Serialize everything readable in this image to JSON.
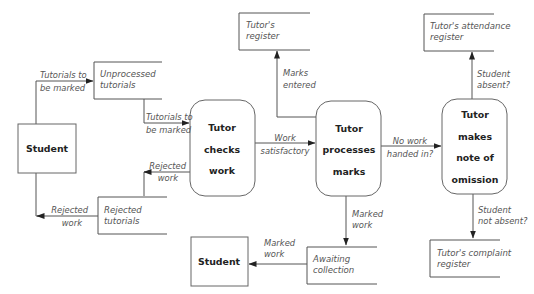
{
  "diagram": {
    "type": "data-flow-diagram",
    "external_entities": [
      {
        "id": "student_left",
        "label": "Student"
      },
      {
        "id": "student_bottom",
        "label": "Student"
      }
    ],
    "processes": [
      {
        "id": "checks",
        "lines": [
          "Tutor",
          "checks",
          "work"
        ]
      },
      {
        "id": "processes",
        "lines": [
          "Tutor",
          "processes",
          "marks"
        ]
      },
      {
        "id": "omission",
        "lines": [
          "Tutor",
          "makes",
          "note of",
          "omission"
        ]
      }
    ],
    "data_stores": [
      {
        "id": "unprocessed",
        "lines": [
          "Unprocessed",
          "tutorials"
        ]
      },
      {
        "id": "rejected",
        "lines": [
          "Rejected",
          "tutorials"
        ]
      },
      {
        "id": "tutors_register",
        "lines": [
          "Tutor's",
          "register"
        ]
      },
      {
        "id": "awaiting",
        "lines": [
          "Awaiting",
          "collection"
        ]
      },
      {
        "id": "attendance",
        "lines": [
          "Tutor's attendance",
          "register"
        ]
      },
      {
        "id": "complaint",
        "lines": [
          "Tutor's complaint",
          "register"
        ]
      }
    ],
    "flows": [
      {
        "id": "f1",
        "from": "student_left",
        "to": "unprocessed",
        "lines": [
          "Tutorials to",
          "be marked"
        ]
      },
      {
        "id": "f2",
        "from": "unprocessed",
        "to": "checks",
        "lines": [
          "Tutorials to",
          "be marked"
        ]
      },
      {
        "id": "f3",
        "from": "checks",
        "to": "rejected",
        "lines": [
          "Rejected",
          "work"
        ]
      },
      {
        "id": "f4",
        "from": "rejected",
        "to": "student_left",
        "lines": [
          "Rejected",
          "work"
        ]
      },
      {
        "id": "f5",
        "from": "checks",
        "to": "processes",
        "lines": [
          "Work",
          "satisfactory"
        ]
      },
      {
        "id": "f6",
        "from": "processes",
        "to": "tutors_register",
        "lines": [
          "Marks",
          "entered"
        ]
      },
      {
        "id": "f7",
        "from": "processes",
        "to": "awaiting",
        "lines": [
          "Marked",
          "work"
        ]
      },
      {
        "id": "f8",
        "from": "awaiting",
        "to": "student_bottom",
        "lines": [
          "Marked",
          "work"
        ]
      },
      {
        "id": "f9",
        "from": "processes",
        "to": "omission",
        "lines": [
          "No work",
          "handed in?"
        ]
      },
      {
        "id": "f10",
        "from": "omission",
        "to": "attendance",
        "lines": [
          "Student",
          "absent?"
        ]
      },
      {
        "id": "f11",
        "from": "omission",
        "to": "complaint",
        "lines": [
          "Student",
          "not absent?"
        ]
      }
    ]
  }
}
